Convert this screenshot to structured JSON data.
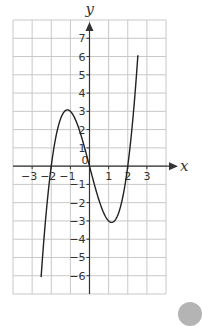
{
  "chart_data": {
    "type": "line",
    "title": "",
    "xlabel": "x",
    "ylabel": "y",
    "xlim": [
      -4,
      4
    ],
    "ylim": [
      -7,
      8
    ],
    "grid": true,
    "x_ticks": [
      -3,
      -2,
      -1,
      0,
      1,
      2,
      3
    ],
    "y_ticks": [
      -6,
      -5,
      -4,
      -3,
      -2,
      -1,
      1,
      2,
      3,
      4,
      5,
      6,
      7
    ],
    "origin_label": "0",
    "series": [
      {
        "name": "y = x^3 - 4x",
        "x_range": [
          -2.53,
          2.53
        ],
        "key_points": [
          {
            "x": -2.53,
            "y": -6
          },
          {
            "x": -2,
            "y": 0
          },
          {
            "x": -1.15,
            "y": 3.08
          },
          {
            "x": 0,
            "y": 0
          },
          {
            "x": 1.15,
            "y": -3.08
          },
          {
            "x": 2,
            "y": 0
          },
          {
            "x": 2.53,
            "y": 7
          }
        ]
      }
    ]
  },
  "colors": {
    "grid": "#c8c8c8",
    "axis": "#333333",
    "curve": "#222222",
    "badge": "#b4b4b4"
  }
}
